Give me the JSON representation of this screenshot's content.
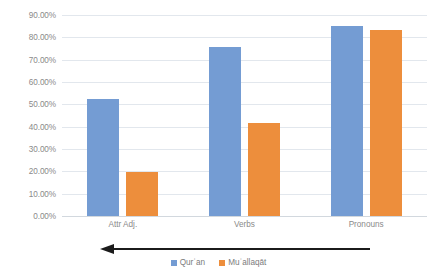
{
  "chart_data": {
    "type": "bar",
    "title": "",
    "subtitle": "",
    "xlabel": "",
    "ylabel": "",
    "categories": [
      "Attr Adj.",
      "Verbs",
      "Pronouns"
    ],
    "series": [
      {
        "name": "Qurʾan",
        "color": "#749CD3",
        "values": [
          52.5,
          75.5,
          85.0
        ]
      },
      {
        "name": "Muʿallaqāt",
        "color": "#ED8E3C",
        "values": [
          19.5,
          41.5,
          83.5
        ]
      }
    ],
    "ylim": [
      0,
      90
    ],
    "ytick_step": 10,
    "ytick_labels": [
      "0.00%",
      "10.00%",
      "20.00%",
      "30.00%",
      "40.00%",
      "50.00%",
      "60.00%",
      "70.00%",
      "80.00%",
      "90.00%"
    ],
    "ytick_values": [
      0,
      10,
      20,
      30,
      40,
      50,
      60,
      70,
      80,
      90
    ],
    "grid": true,
    "grid_axis": "y",
    "legend_position": "bottom",
    "annotations": [
      {
        "name": "trend-arrow",
        "type": "arrow",
        "direction": "left",
        "color": "#1b1b1b"
      }
    ],
    "background": "#ffffff",
    "grid_color": "#e2e7ed",
    "tick_label_color": "#8a8a8a"
  }
}
